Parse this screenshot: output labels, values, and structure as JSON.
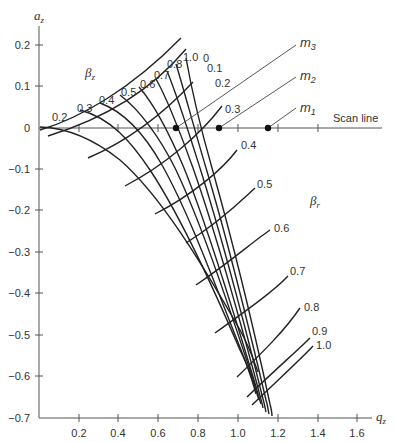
{
  "axes": {
    "y_label": "a",
    "y_label_sub": "z",
    "x_label": "q",
    "x_label_sub": "z",
    "y_ticks": [
      "0.2",
      "0.1",
      "0",
      "−0.1",
      "−0.2",
      "−0.3",
      "−0.4",
      "−0.5",
      "−0.6",
      "−0.7"
    ],
    "x_ticks": [
      "0.2",
      "0.4",
      "0.6",
      "0.8",
      "1.0",
      "1.2",
      "1.4",
      "1.6"
    ]
  },
  "families": {
    "beta_z": {
      "symbol": "β",
      "sub": "z",
      "labels": [
        "0.2",
        "0.3",
        "0.4",
        "0.5",
        "0.6",
        "0.7",
        "0.8",
        "1.0"
      ]
    },
    "beta_r": {
      "symbol": "β",
      "sub": "r",
      "labels": [
        "0",
        "0.1",
        "0.2",
        "0.3",
        "0.4",
        "0.5",
        "0.6",
        "0.7",
        "0.8",
        "0.9",
        "1.0"
      ]
    }
  },
  "scan_line": {
    "label": "Scan line",
    "operating_points": [
      {
        "name": "m",
        "sub": "3",
        "q": 0.69
      },
      {
        "name": "m",
        "sub": "2",
        "q": 0.9
      },
      {
        "name": "m",
        "sub": "1",
        "q": 1.15
      }
    ]
  }
}
